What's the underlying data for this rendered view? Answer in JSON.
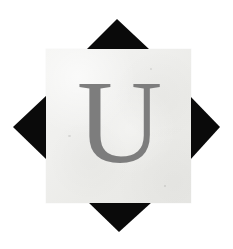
{
  "image": {
    "title": "Letter tile on black four-point diamond",
    "width": 233,
    "height": 249,
    "background_color": "#ffffff"
  },
  "tile": {
    "letter": "U",
    "letter_color": "#7d7d7d",
    "tile_color": "#efefed",
    "tile_left": 46,
    "tile_top": 49,
    "tile_width": 145,
    "tile_height": 154,
    "typeface_style": "serif"
  },
  "diamond": {
    "color": "#0a0a0a",
    "shape_name": "four-point-star-diamond",
    "points": {
      "top": [
        117,
        19
      ],
      "right": [
        220,
        127
      ],
      "bottom": [
        119,
        232
      ],
      "left": [
        13,
        127
      ]
    },
    "triangles": [
      {
        "name": "top-triangle",
        "apex": [
          117,
          19
        ],
        "base_left": [
          86,
          50
        ],
        "base_right": [
          150,
          50
        ]
      },
      {
        "name": "right-triangle",
        "apex": [
          220,
          127
        ],
        "base_top": [
          190,
          96
        ],
        "base_bottom": [
          190,
          160
        ]
      },
      {
        "name": "bottom-triangle",
        "apex": [
          119,
          232
        ],
        "base_left": [
          88,
          202
        ],
        "base_right": [
          152,
          202
        ]
      },
      {
        "name": "left-triangle",
        "apex": [
          13,
          127
        ],
        "base_top": [
          47,
          95
        ],
        "base_bottom": [
          47,
          160
        ]
      }
    ]
  }
}
